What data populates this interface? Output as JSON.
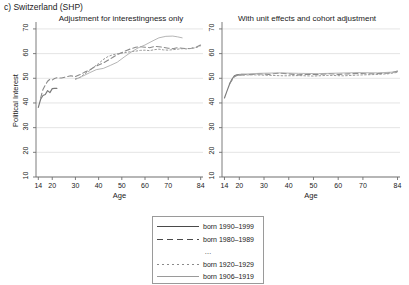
{
  "panel_label": "c) Switzerland (SHP)",
  "axis": {
    "y_title": "Political Interest",
    "x_title": "Age",
    "y_ticks": [
      10,
      20,
      30,
      40,
      50,
      60,
      70
    ],
    "x_ticks": [
      14,
      20,
      30,
      40,
      50,
      60,
      70,
      84
    ],
    "ylim": [
      10,
      72
    ],
    "xlim": [
      13,
      85
    ]
  },
  "legend": {
    "entries": [
      {
        "label": "born 1990–1999",
        "style": "solid"
      },
      {
        "label": "born 1980–1989",
        "style": "dash"
      },
      {
        "label": "…",
        "style": "ellipsis"
      },
      {
        "label": "born 1920–1929",
        "style": "dot"
      },
      {
        "label": "born 1906–1919",
        "style": "thin"
      }
    ]
  },
  "chart_data": [
    {
      "type": "line",
      "title": "Adjustment for interestingness only",
      "xlabel": "Age",
      "ylabel": "Political Interest",
      "xlim": [
        13,
        85
      ],
      "ylim": [
        10,
        72
      ],
      "grid": true,
      "series": [
        {
          "name": "born 1990–1999",
          "style": "solid",
          "color": "#7a7a7a",
          "x": [
            14,
            15,
            16,
            17,
            18,
            19,
            20,
            21,
            22
          ],
          "y": [
            38.2,
            41.5,
            43.0,
            43.4,
            45.0,
            44.2,
            45.8,
            45.9,
            45.9
          ]
        },
        {
          "name": "born 1980–1989",
          "style": "dash",
          "color": "#8a8a8a",
          "x": [
            15,
            16,
            17,
            18,
            19,
            20,
            21,
            22,
            24,
            26,
            28,
            30,
            32,
            34,
            36,
            38,
            40,
            42,
            44,
            46,
            48,
            50,
            52,
            54,
            56,
            58,
            60,
            62,
            64,
            66,
            68,
            70,
            72,
            74,
            76,
            78,
            80,
            82,
            84
          ],
          "y": [
            42.0,
            45.5,
            47.2,
            48.8,
            49.6,
            49.3,
            49.9,
            50.2,
            50.1,
            50.6,
            51.0,
            50.7,
            51.5,
            52.5,
            53.3,
            54.5,
            55.4,
            56.2,
            57.3,
            58.4,
            59.6,
            60.4,
            61.3,
            62.0,
            62.6,
            62.8,
            62.6,
            62.4,
            62.9,
            62.8,
            62.5,
            62.2,
            62.0,
            62.4,
            62.2,
            62.0,
            62.2,
            62.6,
            63.5
          ]
        },
        {
          "name": "born 1920–1929",
          "style": "dot",
          "color": "#9a9a9a",
          "x": [
            30,
            32,
            34,
            36,
            38,
            40,
            42,
            44,
            46,
            48,
            50,
            52,
            54,
            56,
            58,
            60,
            62,
            64,
            66,
            68,
            70,
            72,
            74,
            76,
            78,
            80,
            82,
            84
          ],
          "y": [
            49.8,
            50.4,
            51.8,
            53.0,
            54.6,
            56.0,
            57.6,
            58.8,
            59.5,
            59.9,
            60.2,
            60.5,
            60.8,
            61.0,
            61.3,
            61.4,
            61.2,
            61.6,
            61.8,
            61.5,
            61.4,
            61.6,
            61.8,
            62.0,
            61.9,
            62.1,
            62.4,
            63.2
          ]
        },
        {
          "name": "born 1906–1919",
          "style": "thin",
          "color": "#a8a8a8",
          "x": [
            30,
            33,
            36,
            39,
            42,
            45,
            48,
            51,
            54,
            57,
            60,
            63,
            66,
            69,
            72,
            74,
            76
          ],
          "y": [
            49.5,
            50.8,
            52.2,
            53.5,
            54.0,
            55.2,
            56.5,
            58.6,
            60.6,
            62.3,
            63.5,
            65.0,
            66.4,
            67.0,
            67.1,
            66.8,
            66.4
          ]
        }
      ]
    },
    {
      "type": "line",
      "title": "With unit effects and cohort adjustment",
      "xlabel": "Age",
      "ylabel": "",
      "xlim": [
        13,
        85
      ],
      "ylim": [
        10,
        72
      ],
      "grid": true,
      "series": [
        {
          "name": "born 1990–1999",
          "style": "solid",
          "color": "#7a7a7a",
          "x": [
            14,
            15,
            16,
            17,
            18,
            19,
            20,
            21,
            22
          ],
          "y": [
            42.0,
            44.8,
            47.5,
            49.6,
            51.0,
            51.4,
            51.5,
            51.4,
            51.5
          ]
        },
        {
          "name": "born 1980–1989",
          "style": "dash",
          "color": "#8a8a8a",
          "x": [
            16,
            18,
            20,
            24,
            28,
            32,
            36,
            40,
            44,
            48,
            52,
            56,
            60,
            64,
            68,
            72,
            76,
            80,
            82,
            84
          ],
          "y": [
            47.8,
            50.6,
            51.6,
            51.5,
            51.8,
            51.6,
            52.1,
            51.8,
            51.4,
            51.6,
            51.5,
            51.9,
            51.6,
            51.8,
            52.0,
            51.8,
            51.9,
            52.1,
            52.4,
            52.9
          ]
        },
        {
          "name": "born 1920–1929",
          "style": "dot",
          "color": "#9a9a9a",
          "x": [
            20,
            26,
            32,
            38,
            44,
            50,
            56,
            62,
            68,
            74,
            80,
            84
          ],
          "y": [
            51.3,
            51.4,
            51.2,
            51.0,
            51.1,
            50.9,
            51.2,
            51.0,
            51.3,
            51.5,
            51.8,
            52.4
          ]
        },
        {
          "name": "born 1906–1919",
          "style": "thin",
          "color": "#a8a8a8",
          "x": [
            20,
            28,
            36,
            44,
            52,
            60,
            68,
            76,
            84
          ],
          "y": [
            51.6,
            52.0,
            52.2,
            52.0,
            51.9,
            52.1,
            52.3,
            52.2,
            52.6
          ]
        }
      ]
    }
  ]
}
